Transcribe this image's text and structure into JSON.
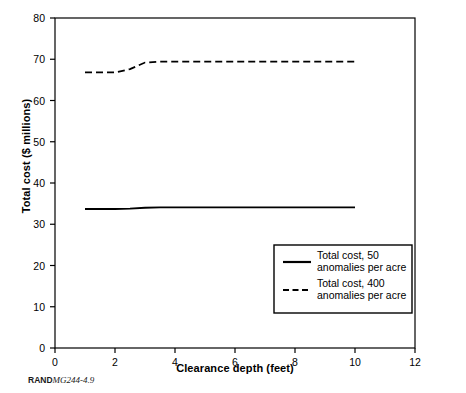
{
  "chart_data": {
    "type": "line",
    "title": "",
    "xlabel": "Clearance depth (feet)",
    "ylabel": "Total cost ($ millions)",
    "xlim": [
      0,
      12
    ],
    "ylim": [
      0,
      80
    ],
    "xticks": [
      0,
      2,
      4,
      6,
      8,
      10,
      12
    ],
    "xtick_labels": [
      "0",
      "2",
      "4",
      "6",
      "8",
      "10",
      "12"
    ],
    "yticks": [
      0,
      10,
      20,
      30,
      40,
      50,
      60,
      70,
      80
    ],
    "ytick_labels": [
      "0",
      "10",
      "20",
      "30",
      "40",
      "50",
      "60",
      "70",
      "80"
    ],
    "grid": false,
    "legend_position": "lower right",
    "series": [
      {
        "name": "Total cost, 50 anomalies per acre",
        "style": "solid",
        "x": [
          1,
          1.5,
          2,
          2.5,
          3,
          3.5,
          4,
          5,
          6,
          7,
          8,
          9,
          10
        ],
        "values": [
          33.7,
          33.7,
          33.7,
          33.8,
          34.0,
          34.1,
          34.1,
          34.1,
          34.1,
          34.1,
          34.1,
          34.1,
          34.1
        ]
      },
      {
        "name": "Total cost, 400 anomalies per acre",
        "style": "dashed",
        "x": [
          1,
          1.5,
          2,
          2.5,
          3,
          3.5,
          4,
          5,
          6,
          7,
          8,
          9,
          10
        ],
        "values": [
          66.8,
          66.8,
          66.8,
          67.6,
          69.2,
          69.4,
          69.4,
          69.4,
          69.4,
          69.4,
          69.4,
          69.4,
          69.4
        ]
      }
    ]
  },
  "legend": {
    "entries": [
      {
        "line1": "Total cost, 50",
        "line2": "anomalies per acre",
        "style": "solid"
      },
      {
        "line1": "Total cost, 400",
        "line2": "anomalies per acre",
        "style": "dashed"
      }
    ]
  },
  "credit": {
    "org": "RAND",
    "figure_number": "MG244-4.9"
  }
}
